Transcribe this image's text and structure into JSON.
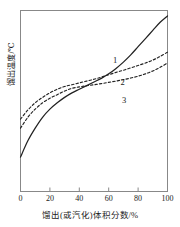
{
  "chart_data": {
    "type": "line",
    "title": "",
    "xlabel": "馏出(或汽化)体积分数/%",
    "ylabel": "馏出温度/℃",
    "xlim": [
      0,
      100
    ],
    "xticks": [
      0,
      20,
      40,
      60,
      80,
      100
    ],
    "xtick_labels": [
      "0",
      "20",
      "40",
      "60",
      "80",
      "100"
    ],
    "ylim": [
      0,
      100
    ],
    "yticks": [],
    "ytick_labels": [],
    "grid": false,
    "legend": "inline-annotations",
    "annotations": [
      {
        "text": "1",
        "x": 63,
        "y": 72
      },
      {
        "text": "2",
        "x": 68,
        "y": 60
      },
      {
        "text": "3",
        "x": 69,
        "y": 50
      }
    ],
    "series": [
      {
        "name": "1",
        "label": "1",
        "style": "solid",
        "color": "#222222",
        "x": [
          0,
          5,
          10,
          15,
          20,
          25,
          30,
          35,
          40,
          45,
          50,
          55,
          60,
          65,
          70,
          75,
          80,
          85,
          90,
          95,
          100
        ],
        "y": [
          19,
          28,
          35,
          41,
          45.5,
          49,
          52,
          54.5,
          56.5,
          58.5,
          60.5,
          62.5,
          65,
          68,
          71.5,
          75.5,
          80,
          84.5,
          89,
          93.5,
          97
        ]
      },
      {
        "name": "2",
        "label": "2",
        "style": "dashed",
        "color": "#222222",
        "x": [
          0,
          5,
          10,
          15,
          20,
          25,
          30,
          35,
          40,
          45,
          50,
          55,
          60,
          65,
          70,
          75,
          80,
          85,
          90,
          95,
          100
        ],
        "y": [
          40,
          45,
          49,
          52,
          54.5,
          56.5,
          58,
          59,
          60,
          61,
          62,
          63.2,
          64.5,
          65.8,
          67,
          68.3,
          69.6,
          71,
          72.6,
          74.6,
          77
        ]
      },
      {
        "name": "3",
        "label": "3",
        "style": "dashed",
        "color": "#222222",
        "x": [
          0,
          5,
          10,
          15,
          20,
          25,
          30,
          35,
          40,
          45,
          50,
          55,
          60,
          65,
          70,
          75,
          80,
          85,
          90,
          95,
          100
        ],
        "y": [
          35,
          41,
          45.5,
          49,
          51.5,
          53.5,
          55.5,
          57,
          57.8,
          58.4,
          59,
          59.6,
          60.3,
          61,
          61.8,
          62.7,
          63.7,
          65,
          66.6,
          68.6,
          71
        ]
      }
    ]
  },
  "axes": {
    "frame_color": "#888888",
    "tick_color": "#888888"
  }
}
